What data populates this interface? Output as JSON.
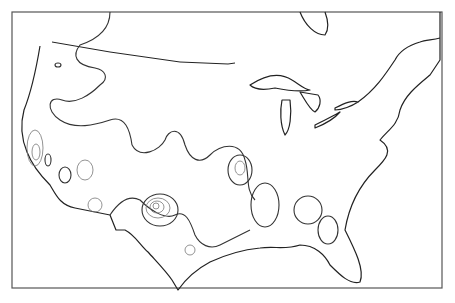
{
  "map": {
    "title": "",
    "region": "Contiguous United States",
    "type": "contour-map",
    "features": [
      "coastline",
      "great-lakes",
      "canada-border",
      "hachured-contours",
      "concentric-highs"
    ],
    "colors": {
      "background": "#ffffff",
      "line": "#222222",
      "frame": "#555555"
    }
  }
}
